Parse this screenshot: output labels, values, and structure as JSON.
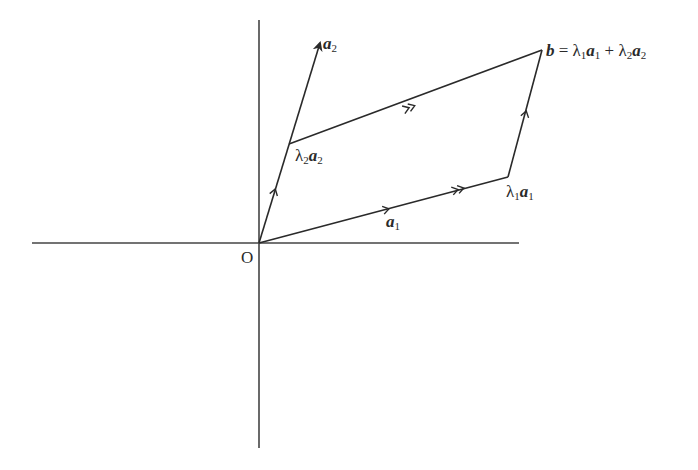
{
  "diagram": {
    "stroke_color": "#333333",
    "origin_label": "O",
    "axes": {
      "x_axis": {
        "from": [
          32,
          243
        ],
        "to": [
          519,
          243
        ]
      },
      "y_axis": {
        "from": [
          259,
          20
        ],
        "to": [
          259,
          448
        ]
      }
    },
    "points": {
      "O": [
        259,
        243
      ],
      "a2_tip": [
        320,
        41
      ],
      "lambda2_a2": [
        289,
        144
      ],
      "lambda1_a1": [
        508,
        177
      ],
      "b": [
        542,
        50
      ]
    },
    "labels": {
      "a2": {
        "vec": "a",
        "sub": "2"
      },
      "a1": {
        "vec": "a",
        "sub": "1"
      },
      "lambda2_a2": {
        "coef": "λ",
        "coef_sub": "2",
        "vec": "a",
        "vec_sub": "2"
      },
      "lambda1_a1": {
        "coef": "λ",
        "coef_sub": "1",
        "vec": "a",
        "vec_sub": "1"
      },
      "b_eq": {
        "lhs": "b",
        "eq": " = ",
        "t1_coef": "λ",
        "t1_coef_sub": "1",
        "t1_vec": "a",
        "t1_vec_sub": "1",
        "plus": " + ",
        "t2_coef": "λ",
        "t2_coef_sub": "2",
        "t2_vec": "a",
        "t2_vec_sub": "2"
      }
    }
  }
}
